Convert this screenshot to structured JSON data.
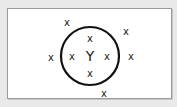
{
  "diagram": {
    "background_color": "#e9e9e9",
    "panel_color": "#ffffff",
    "stroke_color": "#111111",
    "circle": {
      "cx": 90,
      "cy": 56,
      "r": 29,
      "stroke_width": 2.2
    },
    "center_label": {
      "text": "Y",
      "x": 90,
      "y": 56
    },
    "inside_marks": [
      {
        "text": "x",
        "x": 90,
        "y": 38
      },
      {
        "text": "x",
        "x": 72,
        "y": 56
      },
      {
        "text": "x",
        "x": 107,
        "y": 56
      },
      {
        "text": "x",
        "x": 90,
        "y": 73
      }
    ],
    "outside_marks": [
      {
        "text": "x",
        "x": 67,
        "y": 22
      },
      {
        "text": "x",
        "x": 126,
        "y": 31
      },
      {
        "text": "x",
        "x": 51,
        "y": 57
      },
      {
        "text": "x",
        "x": 131,
        "y": 56
      },
      {
        "text": "x",
        "x": 104,
        "y": 93
      }
    ]
  }
}
